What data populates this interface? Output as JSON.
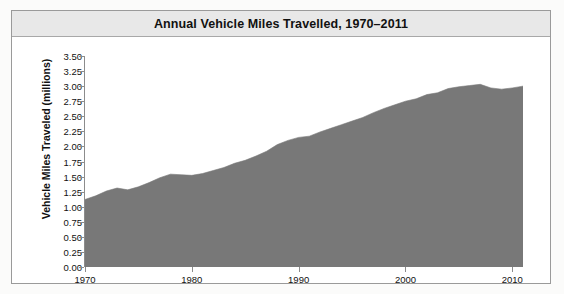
{
  "figure": {
    "title": "Annual Vehicle Miles Travelled, 1970–2011",
    "frame_color": "#9a9a9a",
    "title_bar_color": "#e8e8e8",
    "background_color": "#ffffff"
  },
  "chart_data": {
    "type": "area",
    "title": "Annual Vehicle Miles Travelled, 1970–2011",
    "xlabel": "",
    "ylabel": "Vehicle Miles Traveled (millions)",
    "series_color": "#787878",
    "grid": false,
    "legend": null,
    "xlim": [
      1970,
      2011
    ],
    "ylim": [
      0.0,
      3.5
    ],
    "ytick_labels": [
      "3.50",
      "3.25",
      "3.00",
      "2.75",
      "2.50",
      "2.25",
      "2.00",
      "1.75",
      "1.50",
      "1.25",
      "1.00",
      "0.75",
      "0.50",
      "0.25",
      "0.00"
    ],
    "yticks": [
      3.5,
      3.25,
      3.0,
      2.75,
      2.5,
      2.25,
      2.0,
      1.75,
      1.5,
      1.25,
      1.0,
      0.75,
      0.5,
      0.25,
      0.0
    ],
    "xtick_labels": [
      "1970",
      "1980",
      "1990",
      "2000",
      "2010"
    ],
    "xticks": [
      1970,
      1980,
      1990,
      2000,
      2010
    ],
    "x": [
      1970,
      1971,
      1972,
      1973,
      1974,
      1975,
      1976,
      1977,
      1978,
      1979,
      1980,
      1981,
      1982,
      1983,
      1984,
      1985,
      1986,
      1987,
      1988,
      1989,
      1990,
      1991,
      1992,
      1993,
      1994,
      1995,
      1996,
      1997,
      1998,
      1999,
      2000,
      2001,
      2002,
      2003,
      2004,
      2005,
      2006,
      2007,
      2008,
      2009,
      2010,
      2011
    ],
    "values": [
      1.12,
      1.18,
      1.26,
      1.31,
      1.28,
      1.33,
      1.4,
      1.48,
      1.54,
      1.53,
      1.52,
      1.55,
      1.6,
      1.65,
      1.72,
      1.77,
      1.84,
      1.92,
      2.03,
      2.1,
      2.15,
      2.17,
      2.24,
      2.3,
      2.36,
      2.42,
      2.48,
      2.56,
      2.63,
      2.69,
      2.75,
      2.79,
      2.86,
      2.89,
      2.96,
      2.99,
      3.01,
      3.03,
      2.97,
      2.95,
      2.97,
      3.0
    ],
    "ylabel_units": "millions"
  },
  "axes": {
    "y_title": "Vehicle Miles Traveled (millions)"
  }
}
